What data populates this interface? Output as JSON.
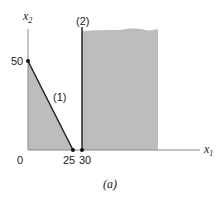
{
  "figure": {
    "caption": "(a)",
    "axes": {
      "x_label": "x",
      "x_label_sub": "1",
      "y_label": "x",
      "y_label_sub": "2",
      "origin_label": "0"
    },
    "ticks": {
      "y_50": "50",
      "x_25": "25",
      "x_30": "30"
    },
    "constraints": [
      {
        "id": "1",
        "label": "(1)",
        "from": [
          0,
          50
        ],
        "to": [
          25,
          0
        ]
      },
      {
        "id": "2",
        "label": "(2)",
        "x": 30
      }
    ],
    "colors": {
      "shade": "#bdbdbd",
      "line": "#1a1a1a",
      "axis": "#888888"
    }
  }
}
